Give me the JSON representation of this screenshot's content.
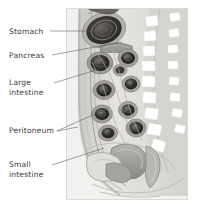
{
  "figure": {
    "background_color": "#ffffff",
    "panel": {
      "name": "anatomical-illustration-panel",
      "x": 66,
      "y": 8,
      "width": 122,
      "height": 192,
      "fill": "#f0efed",
      "border_color": "#d8d6d2"
    },
    "text_color": "#3a3a3a",
    "leader_color": "#555555"
  },
  "labels": [
    {
      "id": "stomach",
      "text": "Stomach",
      "lines": [
        "Stomach"
      ],
      "x": 9,
      "y": 34,
      "leader": "M 50 31 L 110 31",
      "points_to": "dark concentric oval organ at top of cavity"
    },
    {
      "id": "pancreas",
      "text": "Pancreas",
      "lines": [
        "Pancreas"
      ],
      "x": 9,
      "y": 58,
      "leader": "M 52 55 L 122 42",
      "points_to": "elongated gland behind the stomach"
    },
    {
      "id": "large-intestine",
      "text": "Large intestine",
      "lines": [
        "Large",
        "intestine"
      ],
      "x": 9,
      "y": 85,
      "leader": "M 54 83 L 112 65",
      "points_to": "large bowel loop cross-section"
    },
    {
      "id": "peritoneum",
      "text": "Peritoneum",
      "lines": [
        "Peritoneum"
      ],
      "x": 9,
      "y": 133,
      "leader": "M 57 131 L 78 127 M 57 131 L 108 108",
      "points_to": "serous membrane lining the cavity"
    },
    {
      "id": "small-intestine",
      "text": "Small intestine",
      "lines": [
        "Small",
        "intestine"
      ],
      "x": 9,
      "y": 167,
      "leader": "M 52 165 L 104 148",
      "points_to": "coiled small bowel in lower abdomen"
    }
  ],
  "anatomy": {
    "spine": {
      "name": "vertebral-column",
      "vertebra_fill": "#ffffff",
      "column_fill": "#cfcdc9",
      "vertebra_count": 11
    },
    "organs": [
      {
        "name": "stomach",
        "shade": "#3b3b3b"
      },
      {
        "name": "pancreas",
        "shade": "#4a4a4a"
      },
      {
        "name": "large-intestine",
        "shade": "#2e2e2e"
      },
      {
        "name": "small-intestine",
        "shade": "#8e8c88"
      },
      {
        "name": "peritoneum",
        "shade": "#b8b6b2"
      },
      {
        "name": "bladder",
        "shade": "#d5d3cf"
      },
      {
        "name": "rectum",
        "shade": "#a9a7a3"
      }
    ],
    "body_wall_fill": "#dedcd8"
  }
}
